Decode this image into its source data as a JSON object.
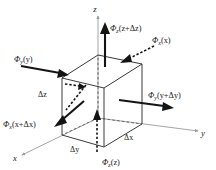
{
  "figure": {
    "background_color": "#ffffff",
    "width": 216,
    "height": 170
  },
  "axes": [
    {
      "id": "z",
      "label": "z",
      "name": "z-axis",
      "direction": "up",
      "color": "#9b9b9b"
    },
    {
      "id": "y",
      "label": "y",
      "name": "y-axis",
      "direction": "lower-right",
      "color": "#9b9b9b"
    },
    {
      "id": "x",
      "label": "x",
      "name": "x-axis",
      "direction": "lower-left",
      "color": "#9b9b9b"
    }
  ],
  "flux_labels": {
    "z_top": {
      "phi": "Φ",
      "sub": "z",
      "arg": "(z+Δz)",
      "full": "Φz(z+Δz)",
      "arrow": "solid-up",
      "face": "top"
    },
    "z_bottom": {
      "phi": "Φ",
      "sub": "z",
      "arg": "(z)",
      "full": "Φz(z)",
      "arrow": "dashed-up",
      "face": "bottom"
    },
    "y_left": {
      "phi": "Φ",
      "sub": "y",
      "arg": "(y)",
      "full": "Φy(y)",
      "arrow": "solid-right",
      "face": "left"
    },
    "y_right": {
      "phi": "Φ",
      "sub": "y",
      "arg": "(y+Δy)",
      "full": "Φy(y+Δy)",
      "arrow": "solid-right",
      "face": "right"
    },
    "x_back": {
      "phi": "Φ",
      "sub": "x",
      "arg": "(x)",
      "full": "Φx(x)",
      "arrow": "dashed-down-left",
      "face": "back"
    },
    "x_front": {
      "phi": "Φ",
      "sub": "x",
      "arg": "(x+Δx)",
      "full": "Φx(x+Δx)",
      "arrow": "solid-down-left",
      "face": "front"
    }
  },
  "dimension_labels": [
    {
      "id": "dz",
      "text": "Δz",
      "edge": "left-vertical-edge"
    },
    {
      "id": "dy",
      "text": "Δy",
      "edge": "bottom-front-left-edge"
    },
    {
      "id": "dx",
      "text": "Δx",
      "edge": "bottom-front-right-edge"
    }
  ],
  "colors": {
    "axis": "#9b9b9b",
    "edge_solid": "#3a3a3a",
    "edge_hidden": "#5a5a5a",
    "arrow": "#141414",
    "text": "#1a1a1a"
  }
}
